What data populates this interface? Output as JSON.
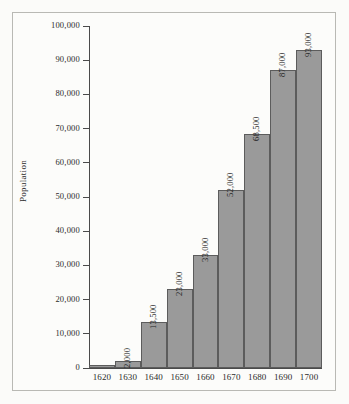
{
  "chart_data": {
    "type": "bar",
    "title": "",
    "subtitle": "",
    "xlabel": "",
    "ylabel": "Population",
    "categories": [
      "1620",
      "1630",
      "1640",
      "1650",
      "1660",
      "1670",
      "1680",
      "1690",
      "1700"
    ],
    "values": [
      1000,
      2000,
      13500,
      23000,
      33000,
      52000,
      68500,
      87000,
      93000
    ],
    "data_labels": [
      "",
      "2,000",
      "13,500",
      "23,000",
      "33,000",
      "52,000",
      "68,500",
      "87,000",
      "93,000"
    ],
    "ylim": [
      0,
      100000
    ],
    "ytick_values": [
      0,
      10000,
      20000,
      30000,
      40000,
      50000,
      60000,
      70000,
      80000,
      90000,
      100000
    ],
    "ytick_labels": [
      "0",
      "10,000",
      "20,000",
      "30,000",
      "40,000",
      "50,000",
      "60,000",
      "70,000",
      "80,000",
      "90,000",
      "100,000"
    ],
    "grid": false,
    "legend": false,
    "legend_position": "none",
    "bar_fill_color": "#9a9a9a",
    "bar_border_color": "#5c5c5c",
    "axis_color": "#4a4a4a",
    "background_color": "#fbfbf9",
    "frame_color": "#b9b9b4",
    "data_label_rotation": 90,
    "ylabel_rotation": 90
  }
}
